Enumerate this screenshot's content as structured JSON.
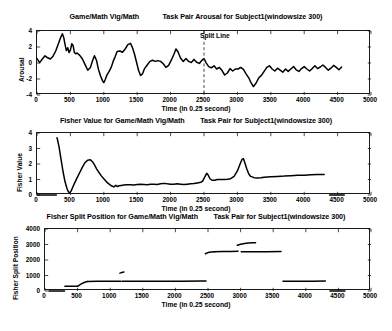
{
  "figure": {
    "title_suffix": "Task Pair for Subject1(windowsize 300)",
    "xlabel": "Time (in 0.25 second)"
  },
  "chart_data": [
    {
      "id": "arousal",
      "type": "line",
      "title": "Game/Math Vig/Math            Task Pair Arousal for Subject1(windowsize 300)",
      "title_left": "Game/Math Vig/Math",
      "title_right": "Task Pair Arousal for Subject1(windowsize 300)",
      "xlabel": "Time (in 0.25 second)",
      "ylabel": "Arousal",
      "xlim": [
        0,
        5000
      ],
      "ylim": [
        -4,
        4
      ],
      "xticks": [
        0,
        500,
        1000,
        1500,
        2000,
        2500,
        3000,
        3500,
        4000,
        4500,
        5000
      ],
      "yticks": [
        -4,
        -2,
        0,
        2,
        4
      ],
      "grid": false,
      "legend": null,
      "annotations": [
        {
          "text": "Split Line",
          "x": 2500,
          "y": 2.55,
          "kind": "vertical-dashed-line-label"
        }
      ],
      "split_line_x": 2500,
      "series": [
        {
          "name": "Arousal",
          "color": "#000000",
          "x": [
            0,
            40,
            80,
            120,
            160,
            200,
            240,
            280,
            320,
            360,
            380,
            400,
            420,
            440,
            460,
            480,
            500,
            520,
            540,
            560,
            580,
            600,
            640,
            680,
            720,
            760,
            800,
            830,
            860,
            890,
            920,
            950,
            980,
            1000,
            1020,
            1050,
            1080,
            1110,
            1140,
            1170,
            1200,
            1240,
            1280,
            1320,
            1360,
            1400,
            1430,
            1460,
            1490,
            1520,
            1550,
            1580,
            1610,
            1650,
            1690,
            1730,
            1770,
            1810,
            1850,
            1890,
            1930,
            1970,
            2010,
            2050,
            2080,
            2110,
            2150,
            2190,
            2230,
            2270,
            2310,
            2350,
            2390,
            2430,
            2470,
            2500,
            2530,
            2570,
            2610,
            2650,
            2690,
            2730,
            2770,
            2810,
            2850,
            2890,
            2930,
            2970,
            3010,
            3050,
            3090,
            3130,
            3170,
            3200,
            3240,
            3280,
            3320,
            3360,
            3400,
            3440,
            3480,
            3520,
            3560,
            3600,
            3640,
            3680,
            3720,
            3760,
            3800,
            3840,
            3880,
            3920,
            3960,
            4000,
            4040,
            4080,
            4120,
            4160,
            4200,
            4240,
            4280,
            4320,
            4360,
            4400,
            4440,
            4480,
            4520,
            4560,
            4600
          ],
          "y": [
            0.55,
            0.05,
            0.5,
            0.9,
            0.65,
            0.5,
            0.85,
            1.5,
            2.4,
            3.3,
            3.65,
            3.2,
            2.3,
            1.55,
            1.9,
            1.3,
            1.6,
            2.4,
            2.2,
            1.3,
            1.15,
            1.25,
            0.95,
            0.5,
            -0.2,
            -0.9,
            -0.55,
            0.25,
            0.9,
            0.35,
            -0.8,
            -1.6,
            -2.2,
            -2.45,
            -2.1,
            -1.45,
            -1.05,
            -0.55,
            0.2,
            0.8,
            1.45,
            1.5,
            1.35,
            1.75,
            2.3,
            2.45,
            1.9,
            1.1,
            0.1,
            -0.9,
            -1.55,
            -1.35,
            -0.7,
            -0.25,
            0.2,
            0.35,
            0.2,
            0.3,
            0.2,
            -0.1,
            -0.55,
            -0.3,
            0.35,
            1.1,
            1.75,
            1.4,
            0.6,
            0.2,
            0.55,
            0.2,
            0.05,
            0.45,
            0.1,
            -0.05,
            0.35,
            0.55,
            0.05,
            -0.45,
            -0.6,
            -0.35,
            -0.75,
            -0.55,
            -0.95,
            -1.5,
            -1.25,
            -0.7,
            -1.0,
            -0.75,
            -0.75,
            -0.55,
            -0.8,
            -1.35,
            -1.85,
            -2.4,
            -2.95,
            -2.5,
            -1.85,
            -1.55,
            -1.05,
            -0.55,
            -0.35,
            -0.75,
            -1.0,
            -0.65,
            -0.9,
            -1.15,
            -0.75,
            -1.05,
            -0.75,
            -0.45,
            -0.85,
            -1.05,
            -0.7,
            -0.45,
            -0.75,
            -1.0,
            -0.7,
            -0.35,
            -0.7,
            -0.5,
            -0.25,
            -0.55,
            -0.9,
            -0.65,
            -0.3,
            -0.55,
            -0.85,
            -0.5
          ]
        }
      ]
    },
    {
      "id": "fisher-value",
      "type": "line",
      "title": "Fisher Value for Game/Math Vig/Math        Task Pair for Subject1(windowsize 300)",
      "title_left": "Fisher Value for Game/Math Vig/Math",
      "title_right": "Task Pair for Subject1(windowsize 300)",
      "xlabel": "Time (in 0.25 second)",
      "ylabel": "Fisher Value",
      "xlim": [
        0,
        5000
      ],
      "ylim": [
        0,
        4
      ],
      "xticks": [
        0,
        500,
        1000,
        1500,
        2000,
        2500,
        3000,
        3500,
        4000,
        4500,
        5000
      ],
      "yticks": [
        0,
        1,
        2,
        3,
        4
      ],
      "grid": false,
      "legend": null,
      "series": [
        {
          "name": "Fisher Value (zero baseline left)",
          "color": "#000000",
          "x": [
            0,
            100,
            200,
            290
          ],
          "y": [
            0,
            0,
            0,
            0
          ]
        },
        {
          "name": "Fisher Value",
          "color": "#000000",
          "x": [
            300,
            330,
            360,
            390,
            420,
            450,
            470,
            490,
            510,
            530,
            560,
            600,
            640,
            680,
            720,
            760,
            800,
            830,
            860,
            890,
            920,
            960,
            1000,
            1040,
            1080,
            1120,
            1150,
            1180,
            1200,
            1230,
            1260,
            1300,
            1350,
            1400,
            1450,
            1500,
            1550,
            1600,
            1650,
            1700,
            1750,
            1800,
            1850,
            1900,
            1950,
            2000,
            2050,
            2100,
            2150,
            2200,
            2250,
            2300,
            2350,
            2400,
            2450,
            2480,
            2510,
            2540,
            2560,
            2590,
            2620,
            2660,
            2700,
            2750,
            2800,
            2850,
            2900,
            2950,
            3000,
            3040,
            3070,
            3090,
            3110,
            3140,
            3170,
            3200,
            3250,
            3300,
            3350,
            3400,
            3500,
            3600,
            3700,
            3800,
            3900,
            4000,
            4100,
            4200,
            4300
          ],
          "y": [
            3.7,
            3.1,
            2.3,
            1.5,
            0.85,
            0.4,
            0.2,
            0.15,
            0.25,
            0.45,
            0.75,
            1.1,
            1.45,
            1.8,
            2.1,
            2.25,
            2.28,
            2.15,
            1.95,
            1.7,
            1.5,
            1.25,
            1.05,
            0.85,
            0.7,
            0.58,
            0.52,
            0.62,
            0.55,
            0.6,
            0.62,
            0.64,
            0.66,
            0.66,
            0.65,
            0.68,
            0.7,
            0.68,
            0.66,
            0.7,
            0.7,
            0.68,
            0.72,
            0.75,
            0.72,
            0.7,
            0.7,
            0.72,
            0.7,
            0.68,
            0.7,
            0.72,
            0.74,
            0.78,
            0.82,
            0.9,
            1.15,
            1.4,
            1.3,
            1.05,
            0.95,
            0.95,
            1.0,
            1.0,
            1.0,
            1.02,
            1.05,
            1.2,
            1.55,
            2.0,
            2.3,
            2.35,
            2.1,
            1.7,
            1.35,
            1.2,
            1.12,
            1.1,
            1.12,
            1.15,
            1.18,
            1.2,
            1.22,
            1.25,
            1.27,
            1.28,
            1.3,
            1.32,
            1.33
          ]
        },
        {
          "name": "Fisher Value (zero baseline right)",
          "color": "#000000",
          "x": [
            4380,
            4450,
            4520,
            4600
          ],
          "y": [
            0,
            0,
            0,
            0
          ]
        }
      ]
    },
    {
      "id": "fisher-split-position",
      "type": "line",
      "title": "Fisher Split Position for Game/Math Vig/Math        Task Pair for Subject1(windowsize 300)",
      "title_left": "Fisher Split Position for Game/Math Vig/Math",
      "title_right": "Task Pair for Subject1(windowsize 300)",
      "xlabel": "Time (in 0.25 second)",
      "ylabel": "Fisher Split Position",
      "xlim": [
        0,
        5000
      ],
      "ylim": [
        0,
        4000
      ],
      "xticks": [
        0,
        500,
        1000,
        1500,
        2000,
        2500,
        3000,
        3500,
        4000,
        4500,
        5000
      ],
      "yticks": [
        0,
        1000,
        2000,
        3000,
        4000
      ],
      "grid": false,
      "legend": null,
      "series": [
        {
          "name": "segment-zero-left",
          "color": "#000000",
          "x": [
            60,
            150,
            250,
            300
          ],
          "y": [
            0,
            0,
            0,
            0
          ]
        },
        {
          "name": "segment-300-500",
          "color": "#000000",
          "x": [
            305,
            380,
            450,
            500
          ],
          "y": [
            300,
            300,
            300,
            300
          ]
        },
        {
          "name": "segment-rise-500-650",
          "color": "#000000",
          "x": [
            505,
            550,
            600,
            650
          ],
          "y": [
            320,
            440,
            550,
            610
          ]
        },
        {
          "name": "segment-650-1160",
          "color": "#000000",
          "x": [
            650,
            800,
            950,
            1100,
            1160
          ],
          "y": [
            620,
            625,
            628,
            630,
            630
          ]
        },
        {
          "name": "segment-blip-1150-1220",
          "color": "#000000",
          "x": [
            1150,
            1180,
            1210
          ],
          "y": [
            1150,
            1200,
            1230
          ]
        },
        {
          "name": "segment-1180-2470",
          "color": "#000000",
          "x": [
            1180,
            1500,
            1800,
            2100,
            2400,
            2470
          ],
          "y": [
            630,
            632,
            634,
            636,
            638,
            640
          ]
        },
        {
          "name": "segment-2460-2600",
          "color": "#000000",
          "x": [
            2460,
            2500,
            2550,
            2600
          ],
          "y": [
            2400,
            2480,
            2520,
            2530
          ]
        },
        {
          "name": "segment-2600-2960",
          "color": "#000000",
          "x": [
            2600,
            2720,
            2850,
            2960
          ],
          "y": [
            2535,
            2545,
            2555,
            2570
          ]
        },
        {
          "name": "segment-2950-3230",
          "color": "#000000",
          "x": [
            2950,
            3000,
            3060,
            3120,
            3180,
            3230
          ],
          "y": [
            2950,
            3020,
            3060,
            3090,
            3110,
            3120
          ]
        },
        {
          "name": "segment-3000-3620",
          "color": "#000000",
          "x": [
            3010,
            3200,
            3400,
            3620
          ],
          "y": [
            2530,
            2535,
            2540,
            2545
          ]
        },
        {
          "name": "segment-3650-4300",
          "color": "#000000",
          "x": [
            3650,
            3900,
            4100,
            4300
          ],
          "y": [
            630,
            632,
            635,
            638
          ]
        },
        {
          "name": "segment-zero-right",
          "color": "#000000",
          "x": [
            4370,
            4450,
            4520,
            4600
          ],
          "y": [
            0,
            0,
            0,
            0
          ]
        }
      ]
    }
  ]
}
